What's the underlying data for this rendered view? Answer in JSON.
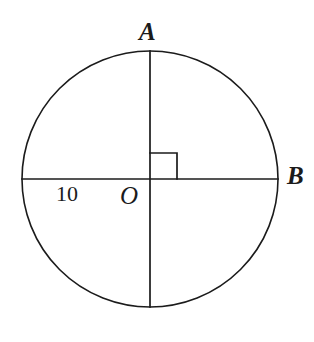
{
  "figure": {
    "background_color": "#ffffff",
    "stroke_color": "#1b1b1b",
    "text_color": "#1b1b1b",
    "stroke_width": 1.6
  },
  "circle": {
    "center_x": 150,
    "center_y": 179,
    "radius": 128,
    "center_label": "O"
  },
  "labels": {
    "top_point": "A",
    "right_point": "B",
    "center_point": "O",
    "radius_measure": "10"
  },
  "segments": [
    {
      "name": "vertical-diameter",
      "x1": 150,
      "y1": 51,
      "x2": 150,
      "y2": 307
    },
    {
      "name": "horizontal-diameter",
      "x1": 22,
      "y1": 179,
      "x2": 278,
      "y2": 179
    }
  ],
  "right_angle_marker": {
    "name": "right-angle-mark",
    "quadrant": "upper-right",
    "x": 150,
    "y": 153,
    "size": 27
  }
}
